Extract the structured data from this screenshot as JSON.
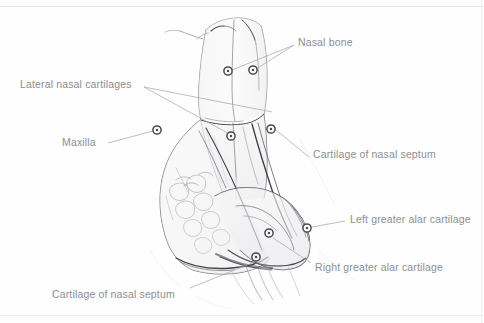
{
  "figure": {
    "medium": "graphite pencil sketch on white paper",
    "view": "anterolateral / oblique view of external nose skeleton",
    "background_color": "#fefefe",
    "border_color": "#e8e8e8",
    "label_color": "#8e8e90",
    "leader_line_color": "#a9a9ab",
    "marker_ring_color": "#4a4a4c",
    "marker_fill_color": "#ffffff",
    "sketch_line_color": "#5a5a5e"
  },
  "labels": [
    {
      "id": "nasal-bone",
      "text": "Nasal bone",
      "x": 298,
      "y": 37,
      "leaders": [
        {
          "x1": 294,
          "y1": 45,
          "x2": 232,
          "y2": 70
        },
        {
          "x1": 294,
          "y1": 45,
          "x2": 256,
          "y2": 69
        }
      ],
      "markers": [
        {
          "x": 228,
          "y": 71
        },
        {
          "x": 253,
          "y": 70
        }
      ]
    },
    {
      "id": "lateral-nasal-cartilages",
      "text": "Lateral nasal cartilages",
      "x": 20,
      "y": 79,
      "leaders": [
        {
          "x1": 144,
          "y1": 87,
          "x2": 233,
          "y2": 136
        },
        {
          "x1": 144,
          "y1": 87,
          "x2": 272,
          "y2": 112
        }
      ],
      "markers": [
        {
          "x": 231,
          "y": 136
        }
      ]
    },
    {
      "id": "maxilla",
      "text": "Maxilla",
      "x": 62,
      "y": 137,
      "leaders": [
        {
          "x1": 108,
          "y1": 143,
          "x2": 153,
          "y2": 131
        }
      ],
      "markers": [
        {
          "x": 157,
          "y": 130
        }
      ]
    },
    {
      "id": "cartilage-of-nasal-septum-upper",
      "text": "Cartilage of nasal septum",
      "x": 313,
      "y": 149,
      "leaders": [
        {
          "x1": 309,
          "y1": 157,
          "x2": 276,
          "y2": 130
        }
      ],
      "markers": [
        {
          "x": 271,
          "y": 129
        }
      ]
    },
    {
      "id": "left-greater-alar-cartilage",
      "text": "Left greater alar cartilage",
      "x": 350,
      "y": 214,
      "leaders": [
        {
          "x1": 345,
          "y1": 221,
          "x2": 312,
          "y2": 227
        }
      ],
      "markers": [
        {
          "x": 307,
          "y": 228
        }
      ]
    },
    {
      "id": "right-greater-alar-cartilage",
      "text": "Right greater alar cartilage",
      "x": 315,
      "y": 262,
      "leaders": [
        {
          "x1": 311,
          "y1": 263,
          "x2": 273,
          "y2": 238
        }
      ],
      "markers": [
        {
          "x": 269,
          "y": 233
        }
      ]
    },
    {
      "id": "cartilage-of-nasal-septum-lower",
      "text": "Cartilage of nasal septum",
      "x": 52,
      "y": 289,
      "leaders": [
        {
          "x1": 190,
          "y1": 288,
          "x2": 257,
          "y2": 261
        }
      ],
      "markers": [
        {
          "x": 256,
          "y": 257
        }
      ]
    }
  ]
}
